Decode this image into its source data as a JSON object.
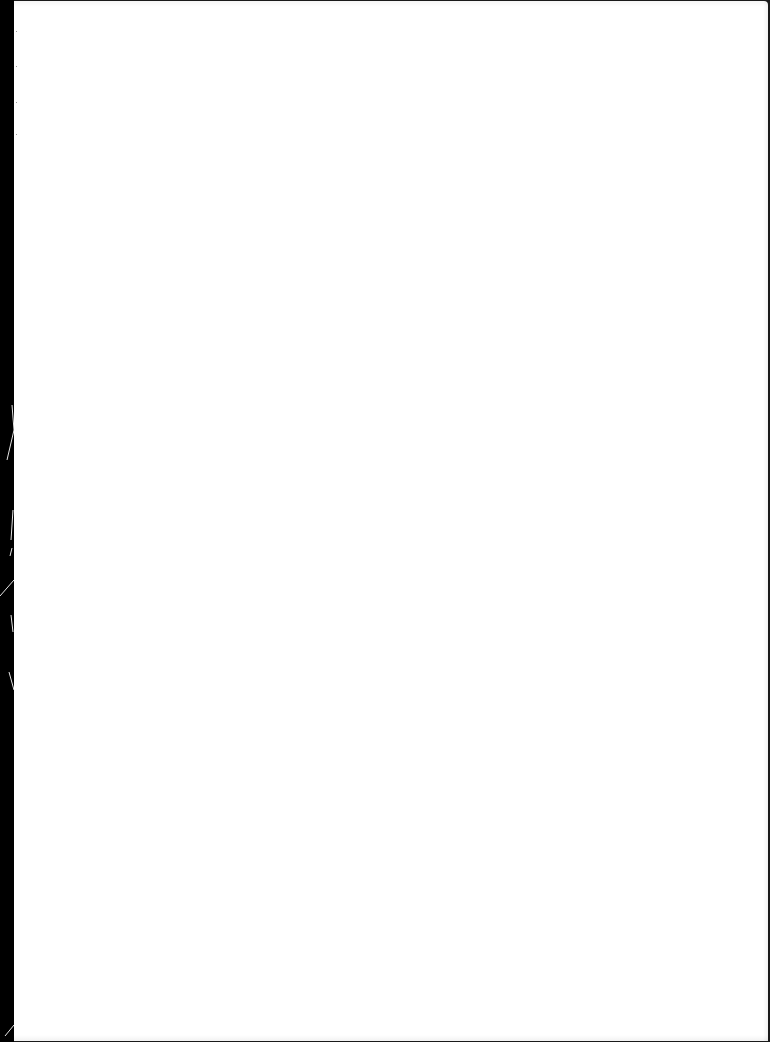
{
  "document": {
    "type": "scanned-page",
    "content": "",
    "is_blank": true
  },
  "colors": {
    "paper": "#ffffff",
    "binding_edge": "#000000",
    "border": "#1a1a1a"
  }
}
